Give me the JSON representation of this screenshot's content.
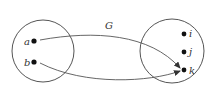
{
  "diagram": {
    "type": "function-mapping",
    "function_label": "G",
    "domain_set": {
      "elements": [
        {
          "id": "a",
          "label": "a"
        },
        {
          "id": "b",
          "label": "b"
        }
      ]
    },
    "codomain_set": {
      "elements": [
        {
          "id": "i",
          "label": "i"
        },
        {
          "id": "j",
          "label": "j"
        },
        {
          "id": "k",
          "label": "k"
        }
      ]
    },
    "mappings": [
      {
        "from": "a",
        "to": "k"
      },
      {
        "from": "b",
        "to": "k"
      }
    ],
    "colors": {
      "stroke": "#555555",
      "dot": "#111111",
      "text": "#333333"
    }
  }
}
